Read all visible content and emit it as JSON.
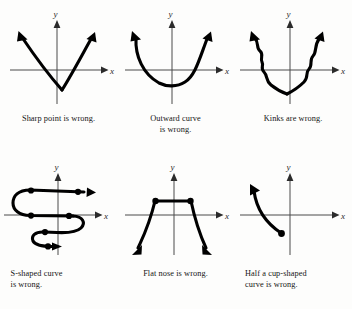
{
  "figure": {
    "background_color": "#fdfdfc",
    "ink_color": "#000000",
    "axis_color": "#4a4a4a"
  },
  "axis_labels": {
    "x": "x",
    "y": "y"
  },
  "panels": [
    {
      "id": "sharp-point",
      "caption": "Sharp point is wrong.",
      "shape": "V with sharp vertex below the x-axis, both arms ending in arrows",
      "arrows": 2,
      "dots": 0
    },
    {
      "id": "outward-curve",
      "caption": "Outward curve\nis wrong.",
      "shape": "U-shaped parabola-like curve with flat rounded bottom, arms flare outward, arrows at both ends",
      "arrows": 2,
      "dots": 0
    },
    {
      "id": "kinks",
      "caption": "Kinks are wrong.",
      "shape": "V-shape with wavy kinks along both arms, arrows at both ends",
      "arrows": 2,
      "dots": 0
    },
    {
      "id": "s-shaped",
      "caption": "S-shaped curve\nis wrong.",
      "shape": "S-shaped curve doubling back on itself with two backward loops, two rightward arrows and marked turning dots",
      "arrows": 2,
      "dots": 6
    },
    {
      "id": "flat-nose",
      "caption": "Flat nose is wrong.",
      "shape": "Trapezoid outline with flat horizontal top between two dots and straight arms descending to arrows",
      "arrows": 2,
      "dots": 2
    },
    {
      "id": "half-cup",
      "caption": "Half a cup-shaped\ncurve is wrong.",
      "shape": "Single decreasing concave curve from upper-left arrow down to a solid endpoint dot below the x-axis",
      "arrows": 1,
      "dots": 1
    }
  ]
}
